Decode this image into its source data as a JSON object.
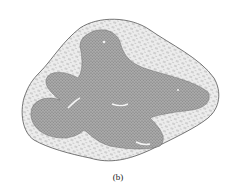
{
  "figure": {
    "caption": "(b)",
    "colors": {
      "background": "#ffffff",
      "outer_tissue": "#e2e2e2",
      "inner_tissue": "#9a9a9a",
      "ink": "#444444"
    }
  }
}
